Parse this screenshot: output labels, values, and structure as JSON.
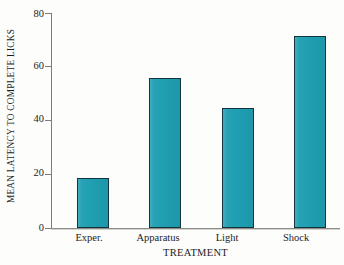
{
  "chart_data": {
    "type": "bar",
    "title": "",
    "subtitle": "",
    "xlabel": "TREATMENT",
    "ylabel": "MEAN LATENCY TO COMPLETE LICKS",
    "categories": [
      "Exper.",
      "Apparatus",
      "Light",
      "Shock"
    ],
    "values": [
      18.5,
      56.0,
      44.5,
      71.5
    ],
    "ylim": [
      0,
      80
    ],
    "yticks": [
      0,
      20,
      40,
      60,
      80
    ],
    "ytick_labels": [
      "0",
      "20",
      "40",
      "60",
      "80"
    ],
    "grid": false,
    "legend": false,
    "legend_position": "none",
    "series": [
      {
        "name": "Mean latency",
        "values": [
          18.5,
          56.0,
          44.5,
          71.5
        ]
      }
    ],
    "annotations": []
  },
  "style": {
    "bar_fill": "#1f9fb2",
    "bar_edge": "#14333c",
    "axis_color": "#7d7d78",
    "background": "#fdfdfc",
    "text_color": "#1c1c1c"
  }
}
